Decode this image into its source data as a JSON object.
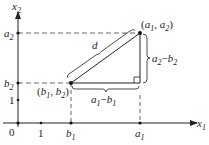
{
  "diagram": {
    "axes": {
      "x_label": "x",
      "x_sub": "1",
      "y_label": "x",
      "y_sub": "2",
      "origin": "0"
    },
    "x_ticks": [
      {
        "label": "1",
        "italic": false
      },
      {
        "label": "b",
        "sub": "1",
        "italic": true
      },
      {
        "label": "a",
        "sub": "1",
        "italic": true
      }
    ],
    "y_ticks": [
      {
        "label": "1",
        "italic": false
      },
      {
        "label": "b",
        "sub": "2",
        "italic": true
      },
      {
        "label": "a",
        "sub": "2",
        "italic": true
      }
    ],
    "points": {
      "p1": {
        "label": "(a1, a2)",
        "a": "a",
        "s1": "1",
        "a2": "a",
        "s2": "2"
      },
      "p2": {
        "label": "(b1, b2)",
        "b": "b",
        "s1": "1",
        "b2": "b",
        "s2": "2"
      }
    },
    "distance_label": "d",
    "horizontal_brace": {
      "text": "a1 − b1",
      "v1": "a",
      "s1": "1",
      "minus": "−",
      "v2": "b",
      "s2": "1"
    },
    "vertical_brace": {
      "text": "a2 − b2",
      "v1": "a",
      "s1": "2",
      "minus": "−",
      "v2": "b",
      "s2": "2"
    },
    "colors": {
      "line": "#222222",
      "dashed": "#555555"
    }
  }
}
